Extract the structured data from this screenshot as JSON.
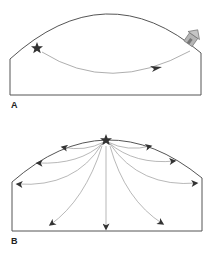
{
  "panels": [
    {
      "label": "A",
      "description": "Single curved path from star to house",
      "icons": [
        "star-icon",
        "house-icon",
        "arrowhead-icon"
      ]
    },
    {
      "label": "B",
      "description": "Many curved paths radiating outward from star at top",
      "icons": [
        "star-icon",
        "arrowhead-icon"
      ],
      "arrow_count": 9
    }
  ],
  "colors": {
    "outline": "#555555",
    "path": "#888888",
    "arrowhead": "#333333",
    "star": "#333333",
    "house_fill": "#b0b0b0",
    "house_stroke": "#666666"
  }
}
